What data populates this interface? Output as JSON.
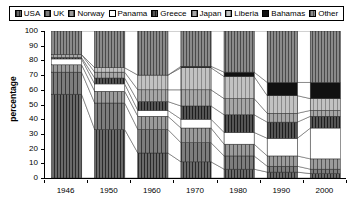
{
  "legend": {
    "position": "top",
    "items": [
      {
        "label": "USA",
        "pattern": "dense-vertical-hatch",
        "color": "#5a5a5a"
      },
      {
        "label": "UK",
        "pattern": "medium-hatch",
        "color": "#6e6e6e"
      },
      {
        "label": "Norway",
        "pattern": "fine-hatch",
        "color": "#8c8c8c"
      },
      {
        "label": "Panama",
        "pattern": "solid-white",
        "color": "#ffffff"
      },
      {
        "label": "Greece",
        "pattern": "dark-hatch",
        "color": "#4a4a4a"
      },
      {
        "label": "Japan",
        "pattern": "medium-gradient",
        "color": "#9a9a9a"
      },
      {
        "label": "Liberia",
        "pattern": "light-hatch",
        "color": "#b4b4b4"
      },
      {
        "label": "Bahamas",
        "pattern": "solid-black",
        "color": "#101010"
      },
      {
        "label": "Other",
        "pattern": "mid-hatch",
        "color": "#787878"
      }
    ]
  },
  "axes": {
    "ylabel": "percentage",
    "yticks": [
      0,
      10,
      20,
      30,
      40,
      50,
      60,
      70,
      80,
      90,
      100
    ],
    "ylim": [
      0,
      100
    ],
    "xlabel": "",
    "xticks": [
      "1946",
      "1950",
      "1960",
      "1970",
      "1980",
      "1990",
      "2000"
    ]
  },
  "chart_data": {
    "type": "area",
    "title": "",
    "subtitle": "",
    "xlabel": "",
    "ylabel": "percentage",
    "ylim": [
      0,
      100
    ],
    "grid": false,
    "legend_position": "top",
    "stacked": true,
    "categories": [
      "1946",
      "1950",
      "1960",
      "1970",
      "1980",
      "1990",
      "2000"
    ],
    "series": [
      {
        "name": "USA",
        "values": [
          57,
          33,
          17,
          11,
          6,
          4,
          3
        ]
      },
      {
        "name": "UK",
        "values": [
          15,
          18,
          16,
          13,
          9,
          4,
          3
        ]
      },
      {
        "name": "Norway",
        "values": [
          5,
          8,
          9,
          10,
          8,
          7,
          7
        ]
      },
      {
        "name": "Panama",
        "values": [
          4,
          5,
          4,
          6,
          8,
          12,
          21
        ]
      },
      {
        "name": "Greece",
        "values": [
          1,
          4,
          6,
          9,
          12,
          11,
          8
        ]
      },
      {
        "name": "Japan",
        "values": [
          2,
          4,
          8,
          11,
          11,
          6,
          4
        ]
      },
      {
        "name": "Liberia",
        "values": [
          0,
          3,
          10,
          15,
          15,
          12,
          8
        ]
      },
      {
        "name": "Bahamas",
        "values": [
          0,
          0,
          0,
          1,
          3,
          9,
          11
        ]
      },
      {
        "name": "Other",
        "values": [
          16,
          25,
          30,
          24,
          28,
          35,
          35
        ]
      }
    ]
  }
}
